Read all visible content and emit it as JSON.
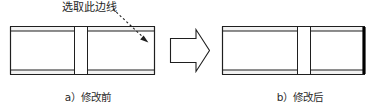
{
  "figure": {
    "annotation": {
      "text": "选取此边线",
      "leader": "dashed-arrow",
      "icon": "dashed-arrow-icon"
    },
    "transition": {
      "icon": "block-arrow-right-icon",
      "direction": "right"
    },
    "panels": [
      {
        "id": "before",
        "caption": "a）修改前",
        "part_name": "banded-block-before",
        "edge_highlighted": false
      },
      {
        "id": "after",
        "caption": "b）修改后",
        "part_name": "banded-block-after",
        "edge_highlighted": true
      }
    ],
    "colors": {
      "line": "#1f1f1f",
      "band_fill": "#f2f2f2",
      "body_fill": "#ffffff",
      "highlight_edge": "#000000",
      "annotation_text": "#262626",
      "caption_text": "#2b2b2b",
      "background": "#ffffff"
    }
  }
}
